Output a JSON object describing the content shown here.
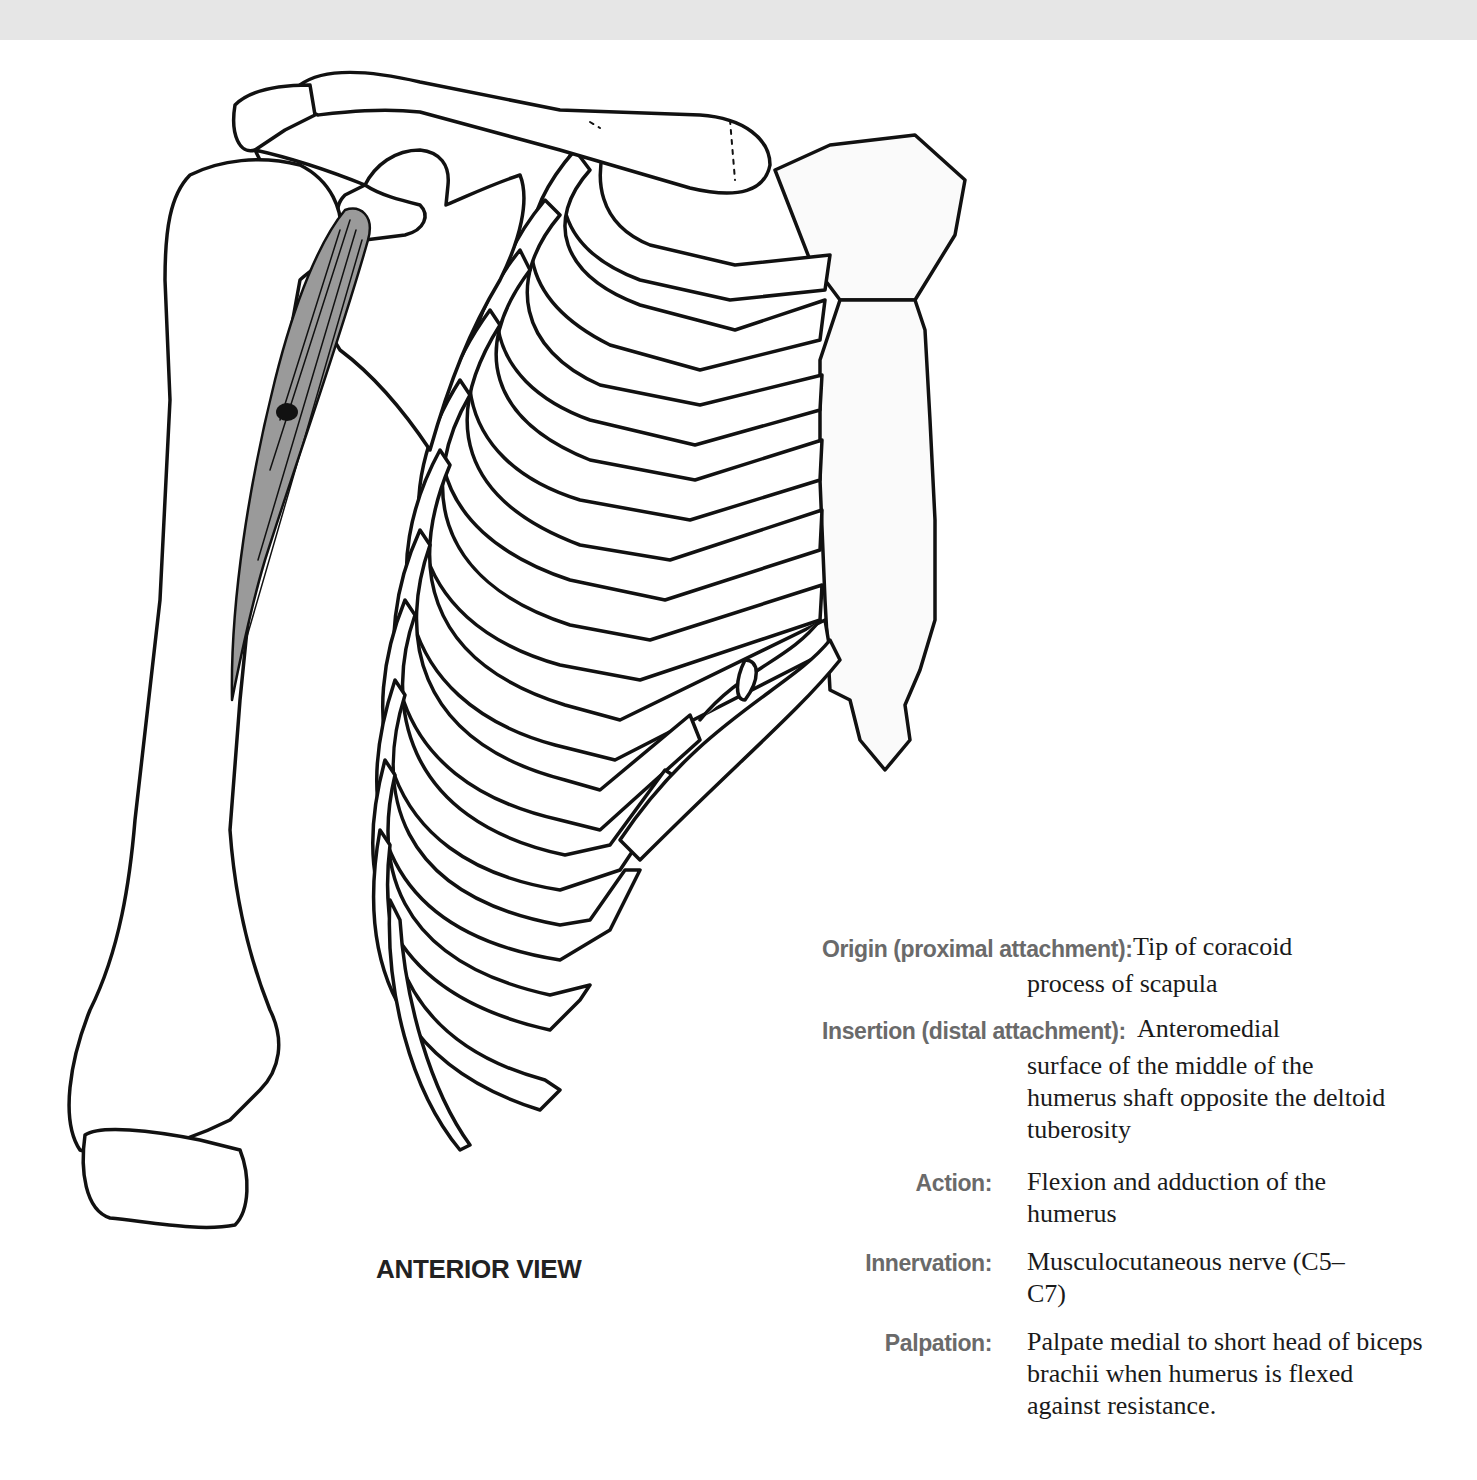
{
  "figure": {
    "caption": "ANTERIOR VIEW",
    "colors": {
      "muscle_fill": "#9a9a9a",
      "line": "#111111",
      "band": "#e6e6e6",
      "label_gray": "#6a6a6a"
    }
  },
  "info": {
    "origin": {
      "label": "Origin (proximal attachment):",
      "first_line": "Tip of coracoid",
      "rest": "process of scapula"
    },
    "insertion": {
      "label": "Insertion (distal attachment):",
      "first_line": "Anteromedial",
      "rest": "surface of the middle of the humerus shaft opposite the deltoid tuberosity"
    },
    "action": {
      "label": "Action:",
      "value": "Flexion and adduction of the humerus"
    },
    "innervation": {
      "label": "Innervation:",
      "value": "Musculocutaneous nerve (C5–C7)"
    },
    "palpation": {
      "label": "Palpation:",
      "value": "Palpate medial to short head of biceps brachii when humerus is flexed against resistance."
    }
  }
}
